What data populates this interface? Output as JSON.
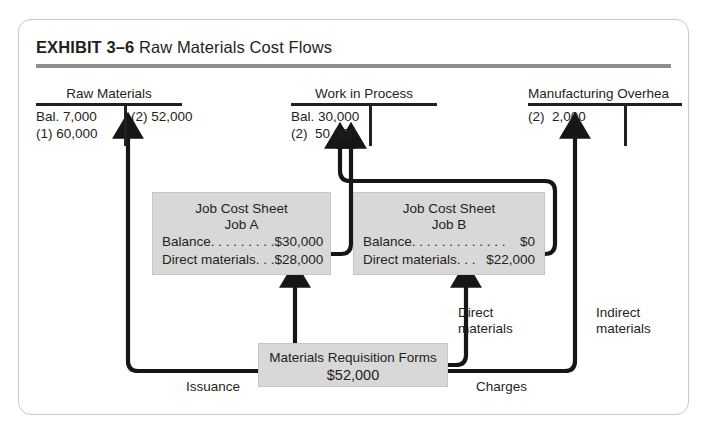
{
  "exhibit": {
    "label": "EXHIBIT 3–6",
    "title": "Raw Materials Cost Flows"
  },
  "colors": {
    "ink": "#231f20",
    "box_fill": "#d8d8d8",
    "card_border": "#c8c9cb",
    "title_rule": "#8b8d90"
  },
  "accounts": [
    {
      "name": "Raw Materials",
      "debit": [
        "Bal. 7,000",
        "(1) 60,000"
      ],
      "credit": [
        "(2) 52,000"
      ]
    },
    {
      "name": "Work in Process",
      "debit": [
        "Bal. 30,000",
        "(2)  50,000"
      ],
      "credit": []
    },
    {
      "name": "Manufacturing Overhea",
      "debit": [
        "(2)  2,000"
      ],
      "credit": []
    }
  ],
  "job_cost_sheets": [
    {
      "heading": "Job Cost Sheet",
      "job": "Job A",
      "rows": [
        {
          "label": "Balance. . . . . . . . .",
          "value": "$30,000"
        },
        {
          "label": "Direct materials. . .",
          "value": "$28,000"
        }
      ]
    },
    {
      "heading": "Job Cost Sheet",
      "job": "Job B",
      "rows": [
        {
          "label": "Balance. . . . . . . . . . . . .",
          "value": "$0"
        },
        {
          "label": "Direct materials. . .",
          "value": "$22,000"
        }
      ]
    }
  ],
  "materials_requisition": {
    "title": "Materials Requisition Forms",
    "amount": "$52,000"
  },
  "flow_labels": {
    "issuance": "Issuance",
    "charges": "Charges",
    "direct_materials_line1": "Direct",
    "direct_materials_line2": "materials",
    "indirect_materials_line1": "Indirect",
    "indirect_materials_line2": "materials"
  }
}
